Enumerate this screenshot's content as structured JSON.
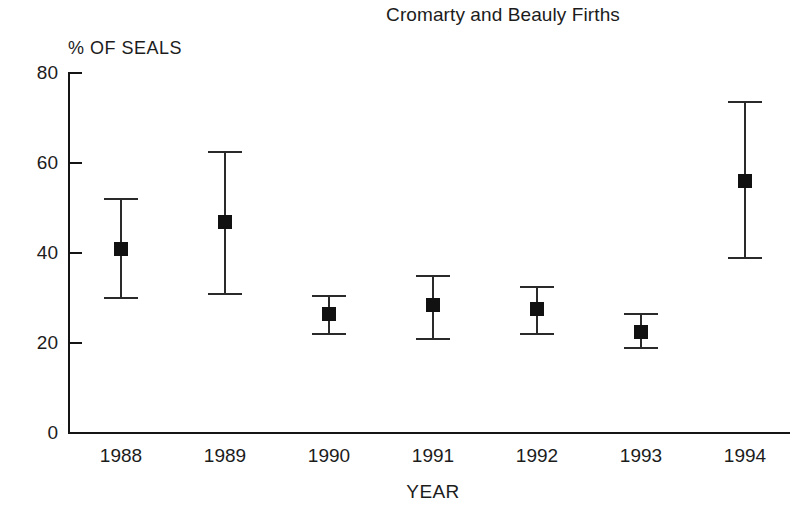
{
  "chart_data": {
    "type": "scatter",
    "title": "Cromarty and Beauly Firths",
    "xlabel": "YEAR",
    "ylabel": "% OF SEALS",
    "categories": [
      "1988",
      "1989",
      "1990",
      "1991",
      "1992",
      "1993",
      "1994"
    ],
    "values": [
      41,
      47,
      26.5,
      28.5,
      27.5,
      22.5,
      56
    ],
    "error_low": [
      30,
      31,
      22,
      21,
      22,
      19,
      39
    ],
    "error_high": [
      52,
      62.5,
      30.5,
      35,
      32.5,
      26.5,
      73.5
    ],
    "ylim": [
      0,
      80
    ],
    "yticks": [
      0,
      20,
      40,
      60,
      80
    ],
    "ytick_labels": [
      "0",
      "20",
      "40",
      "60",
      "80"
    ],
    "grid": false,
    "legend": "none",
    "marker": "filled-square",
    "errorbar_style": "capped-vertical"
  },
  "axis": {
    "y_label_text": "% OF SEALS",
    "x_label_text": "YEAR"
  },
  "colors": {
    "marker": "#111111",
    "errorbar": "#2a2a2a",
    "axis": "#151515",
    "text": "#1c1c1c",
    "background": "#ffffff"
  }
}
